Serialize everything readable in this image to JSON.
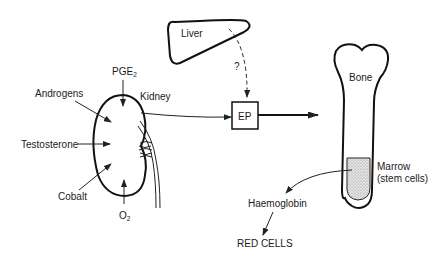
{
  "diagram": {
    "nodes": {
      "liver": {
        "label": "Liver"
      },
      "kidney": {
        "label": "Kidney"
      },
      "ep": {
        "label": "EP"
      },
      "bone": {
        "label": "Bone"
      },
      "marrow": {
        "label_line1": "Marrow",
        "label_line2": "(stem cells)"
      },
      "haemoglobin": {
        "label": "Haemoglobin"
      },
      "red_cells": {
        "label": "RED CELLS"
      }
    },
    "kidney_inputs": {
      "pge2": {
        "label": "PGE",
        "subscript": "2"
      },
      "androgens": {
        "label": "Androgens"
      },
      "testosterone": {
        "label": "Testosterone"
      },
      "cobalt": {
        "label": "Cobalt"
      },
      "o2": {
        "label": "O",
        "subscript": "2"
      }
    },
    "edges": [
      {
        "from": "liver",
        "to": "ep",
        "style": "dashed",
        "label": "?"
      },
      {
        "from": "kidney",
        "to": "ep",
        "style": "solid"
      },
      {
        "from": "ep",
        "to": "bone",
        "style": "solid-bold"
      },
      {
        "from": "marrow",
        "to": "haemoglobin",
        "style": "solid"
      },
      {
        "from": "haemoglobin",
        "to": "red_cells",
        "style": "solid"
      }
    ],
    "liver_ep_edge_label": "?"
  }
}
